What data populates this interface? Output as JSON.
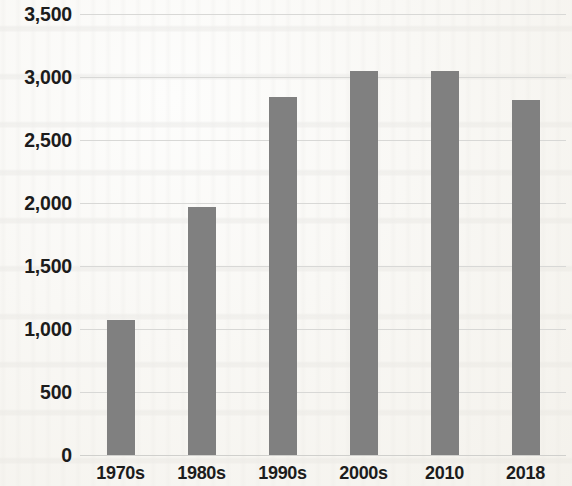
{
  "chart_data": {
    "type": "bar",
    "title": "",
    "subtitle": "",
    "xlabel": "",
    "ylabel": "",
    "categories": [
      "1970s",
      "1980s",
      "1990s",
      "2000s",
      "2010",
      "2018"
    ],
    "values": [
      1070,
      1970,
      2845,
      3045,
      3045,
      2820
    ],
    "series": [
      {
        "name": "",
        "values": [
          1070,
          1970,
          2845,
          3045,
          3045,
          2820
        ]
      }
    ],
    "ylim": [
      0,
      3500
    ],
    "ytick_labels": [
      "3,500",
      "3,000",
      "2,500",
      "2,000",
      "1,500",
      "1,000",
      "500",
      "0"
    ],
    "ytick_values": [
      3500,
      3000,
      2500,
      2000,
      1500,
      1000,
      500,
      0
    ],
    "grid": true,
    "legend": "none",
    "bar_color": "#808080",
    "gridline_color": "#d8d8d6",
    "text_color": "#1c1c1c",
    "background_color": "#fdfdfc"
  }
}
